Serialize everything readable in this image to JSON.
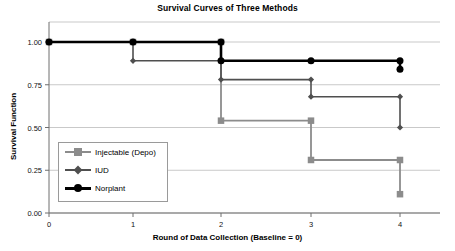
{
  "chart_data": {
    "type": "line",
    "title": "Survival Curves of Three Methods",
    "xlabel": "Round of Data Collection (Baseline = 0)",
    "ylabel": "Survival Function",
    "x": [
      0,
      1,
      2,
      3,
      4
    ],
    "xticklabels": [
      "0",
      "1",
      "2",
      "3",
      "4"
    ],
    "yticklabels": [
      "0.00",
      "0.25",
      "0.50",
      "0.75",
      "1.00"
    ],
    "yticks": [
      0.0,
      0.25,
      0.5,
      0.75,
      1.0
    ],
    "xlim": [
      0,
      4.55
    ],
    "ylim": [
      0.0,
      1.08
    ],
    "grid": true,
    "legend_position": "lower-left-inside",
    "step_style": "post",
    "series": [
      {
        "name": "Injectable (Depo)",
        "marker": "square",
        "color": "#8c8c8c",
        "values": [
          1.0,
          1.0,
          0.54,
          0.31,
          0.11
        ]
      },
      {
        "name": "IUD",
        "marker": "diamond",
        "color": "#4f4f4f",
        "values": [
          1.0,
          0.89,
          0.78,
          0.68,
          0.5
        ]
      },
      {
        "name": "Norplant",
        "marker": "circle",
        "color": "#000000",
        "values": [
          1.0,
          1.0,
          0.89,
          0.89,
          0.84
        ]
      }
    ]
  },
  "legend": {
    "items": [
      {
        "label": "Injectable (Depo)"
      },
      {
        "label": "IUD"
      },
      {
        "label": "Norplant"
      }
    ]
  },
  "colors": {
    "injectable": "#8c8c8c",
    "iud": "#4f4f4f",
    "norplant": "#000000",
    "grid": "#c9c9c9",
    "frame": "#9a9a9a",
    "axis": "#6e6e6e"
  }
}
